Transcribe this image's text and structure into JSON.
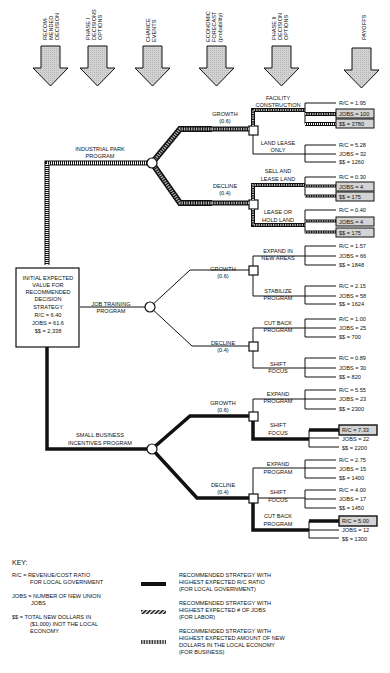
{
  "header": {
    "columns": [
      {
        "lines": [
          "RECOM-",
          "MENDED",
          "DECISION"
        ]
      },
      {
        "lines": [
          "PHASE I",
          "DECISIONS",
          "OPTIONS"
        ]
      },
      {
        "lines": [
          "CHANCE",
          "EVENTS"
        ]
      },
      {
        "lines": [
          "ECONOMIC",
          "FORECAST",
          "(probability)"
        ]
      },
      {
        "lines": [
          "PHASE II",
          "DECISION",
          "OPTIONS"
        ]
      },
      {
        "lines": [
          "PAYOFFS"
        ]
      }
    ]
  },
  "root": {
    "lines": [
      "INITIAL EXPECTED",
      "VALUE FOR",
      "RECOMMENDED",
      "DECISION",
      "STRATEGY",
      "R/C = 6.40",
      "JOBS = 61.6",
      "$$ = 2,338"
    ]
  },
  "programs": [
    {
      "name": [
        "INDUSTRIAL PARK",
        "PROGRAM"
      ],
      "growth": {
        "label": "GROWTH",
        "prob": "(0.6)"
      },
      "decline": {
        "label": "DECLINE",
        "prob": "(0.4)"
      },
      "options": [
        {
          "name": [
            "FACILITY",
            "CONSTRUCTION"
          ],
          "rc": "R/C = 1.95",
          "jobs": "JOBS = 100",
          "dollars": "$$ = 3780"
        },
        {
          "name": [
            "LAND LEASE",
            "ONLY"
          ],
          "rc": "R/C = 5.28",
          "jobs": "JOBS = 32",
          "dollars": "$$ = 1260"
        },
        {
          "name": [
            "SELL AND",
            "LEASE LAND"
          ],
          "rc": "R/C = 0.30",
          "jobs": "JOBS = 4",
          "dollars": "$$ = 175"
        },
        {
          "name": [
            "LEASE OR",
            "HOLD LAND"
          ],
          "rc": "R/C = 0.40",
          "jobs": "JOBS = 4",
          "dollars": "$$ = 175"
        }
      ]
    },
    {
      "name": [
        "JOB TRAINING",
        "PROGRAM"
      ],
      "growth": {
        "label": "GROWTH",
        "prob": "(0.6)"
      },
      "decline": {
        "label": "DECLINE",
        "prob": "(0.4)"
      },
      "options": [
        {
          "name": [
            "EXPAND IN",
            "NEW AREAS"
          ],
          "rc": "R/C = 1.57",
          "jobs": "JOBS = 66",
          "dollars": "$$ = 1848"
        },
        {
          "name": [
            "STABILIZE",
            "PROGRAM"
          ],
          "rc": "R/C = 2.15",
          "jobs": "JOBS = 58",
          "dollars": "$$ = 1624"
        },
        {
          "name": [
            "CUT BACK",
            "PROGRAM"
          ],
          "rc": "R/C = 1.00",
          "jobs": "JOBS = 25",
          "dollars": "$$ = 700"
        },
        {
          "name": [
            "SHIFT",
            "FOCUS"
          ],
          "rc": "R/C = 0.89",
          "jobs": "JOBS = 30",
          "dollars": "$$ = 820"
        }
      ]
    },
    {
      "name": [
        "SMALL BUSINESS",
        "INCENTIVES PROGRAM"
      ],
      "growth": {
        "label": "GROWTH",
        "prob": "(0.6)"
      },
      "decline": {
        "label": "DECLINE",
        "prob": "(0.4)"
      },
      "options": [
        {
          "name": [
            "EXPAND",
            "PROGRAM"
          ],
          "rc": "R/C = 5.55",
          "jobs": "JOBS = 23",
          "dollars": "$$ = 2300"
        },
        {
          "name": [
            "SHIFT",
            "FOCUS"
          ],
          "rc": "R/C = 7.33",
          "jobs": "JOBS = 22",
          "dollars": "$$ = 2200"
        },
        {
          "name": [
            "EXPAND",
            "PROGRAM"
          ],
          "rc": "R/C = 2.75",
          "jobs": "JOBS = 15",
          "dollars": "$$ = 1400"
        },
        {
          "name": [
            "SHIFT",
            "FOCUS"
          ],
          "rc": "R/C = 4.00",
          "jobs": "JOBS = 17",
          "dollars": "$$ = 1450"
        },
        {
          "name": [
            "CUT BACK",
            "PROGRAM"
          ],
          "rc": "R/C = 5.00",
          "jobs": "JOBS = 12",
          "dollars": "$$ = 1300"
        }
      ]
    }
  ],
  "key": {
    "title": "KEY:",
    "definitions": [
      {
        "lines": [
          "R/C = REVENUE/COST RATIO",
          "FOR LOCAL GOVERNMENT"
        ]
      },
      {
        "lines": [
          "JOBS = NUMBER OF NEW UNION",
          "JOBS"
        ]
      },
      {
        "lines": [
          "$$ = TOTAL NEW  DOLLARS IN",
          "($1,000) INOT THE LOCAL",
          "ECONOMY"
        ]
      }
    ],
    "legend": [
      {
        "style": "solid",
        "lines": [
          "RECOMMENDED STRATEGY WITH",
          "HIGHEST EXPECTED R/C RATIO",
          "(FOR LOCAL GOVERNMENT)"
        ]
      },
      {
        "style": "hatched",
        "lines": [
          "RECOMMENDED STRATEGY WITH",
          "HIGHEST EXPECTED # OF JOBS",
          "(FOR LABOR)"
        ]
      },
      {
        "style": "dotted",
        "lines": [
          "RECOMMENDED STRATEGY WITH",
          "HIGHEST EXPECTED AMOUNT OF NEW",
          "DOLLARS IN THE LOCAL ECONOMY",
          "(FOR BUSINESS)"
        ]
      }
    ]
  },
  "colors": {
    "ink": "#111111",
    "arrow_fill": "#cfcfcf",
    "highlight_fill": "#d4d4d4",
    "hatch_light": "#bbbbbb"
  }
}
